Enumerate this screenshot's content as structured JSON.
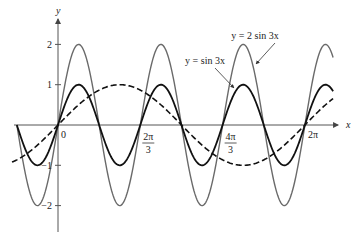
{
  "chart_data": {
    "type": "line",
    "title": "",
    "xlabel": "x",
    "ylabel": "y",
    "xlim": [
      -1.1,
      7.05
    ],
    "ylim": [
      -2.5,
      2.6
    ],
    "grid": false,
    "x_ticks": [
      {
        "value": 0,
        "num": "0",
        "den": ""
      },
      {
        "value": 2.0944,
        "num": "2π",
        "den": "3"
      },
      {
        "value": 4.1888,
        "num": "4π",
        "den": "3"
      },
      {
        "value": 6.2832,
        "num": "2π",
        "den": ""
      }
    ],
    "y_ticks": [
      {
        "value": 2,
        "label": "2"
      },
      {
        "value": 1,
        "label": "1"
      },
      {
        "value": -1,
        "label": "−1"
      },
      {
        "value": -2,
        "label": "−2"
      }
    ],
    "series": [
      {
        "name": "y = 2 sin 3x",
        "function": "2*sin(3x)",
        "amplitude": 2,
        "frequency": 3,
        "x_range": [
          -1.0472,
          7.0
        ],
        "style": "solid-gray",
        "color": "#6a6a6a"
      },
      {
        "name": "y = sin 3x",
        "function": "sin(3x)",
        "amplitude": 1,
        "frequency": 3,
        "x_range": [
          -1.0472,
          7.0
        ],
        "style": "solid-black",
        "color": "#111111"
      },
      {
        "name": "y = sin x",
        "function": "sin(x)",
        "amplitude": 1,
        "frequency": 1,
        "x_range": [
          -1.17,
          7.0
        ],
        "style": "dashed",
        "color": "#111111"
      }
    ],
    "annotations": [
      {
        "text": "y = 2 sin 3x",
        "target_series": 0
      },
      {
        "text": "y = sin 3x",
        "target_series": 1
      }
    ]
  }
}
